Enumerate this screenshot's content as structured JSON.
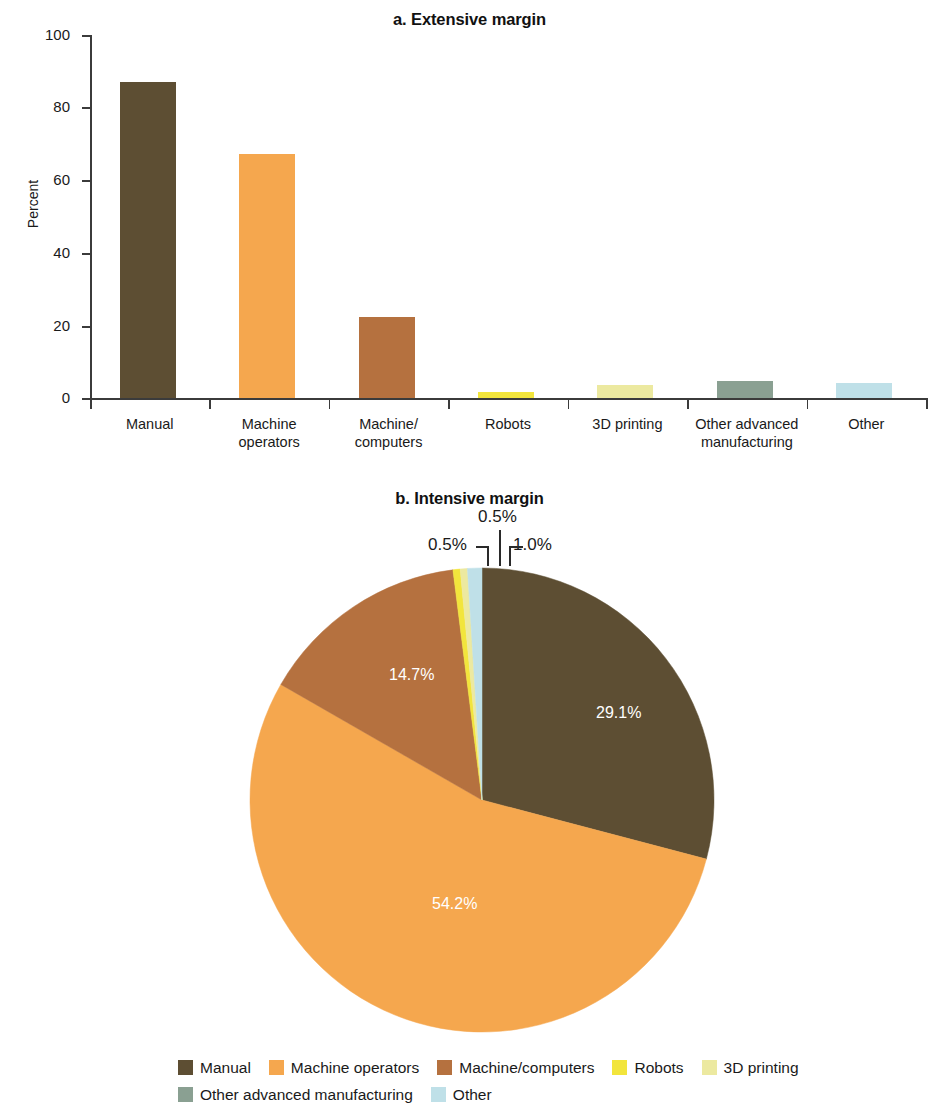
{
  "figure": {
    "panel_a_title": "a. Extensive margin",
    "panel_b_title": "b. Intensive margin"
  },
  "colors": {
    "manual": "#5d4e33",
    "machine_operators": "#f5a74e",
    "machine_computers": "#b5713f",
    "robots": "#f2e53c",
    "printing_3d": "#ece9a0",
    "other_advanced_manufacturing": "#8aa092",
    "other": "#bfe0e8",
    "axis": "#3b3b3b",
    "text": "#1a1a1a",
    "inner_label_text": "#ffffff"
  },
  "chart_data": [
    {
      "type": "bar",
      "title": "a. Extensive margin",
      "xlabel": "",
      "ylabel": "Percent",
      "ylim": [
        0,
        100
      ],
      "yticks": [
        "0",
        "20",
        "40",
        "60",
        "80",
        "100"
      ],
      "grid": false,
      "legend": "none",
      "categories": [
        "Manual",
        "Machine operators",
        "Machine/computers",
        "Robots",
        "3D printing",
        "Other advanced manufacturing",
        "Other"
      ],
      "category_lines": [
        [
          "Manual"
        ],
        [
          "Machine",
          "operators"
        ],
        [
          "Machine/",
          "computers"
        ],
        [
          "Robots"
        ],
        [
          "3D printing"
        ],
        [
          "Other advanced",
          "manufacturing"
        ],
        [
          "Other"
        ]
      ],
      "values": [
        87.0,
        67.2,
        22.3,
        1.6,
        3.6,
        4.8,
        4.0
      ],
      "bar_colors": [
        "#5d4e33",
        "#f5a74e",
        "#b5713f",
        "#f2e53c",
        "#ece9a0",
        "#8aa092",
        "#bfe0e8"
      ]
    },
    {
      "type": "pie",
      "title": "b. Intensive margin",
      "legend": "bottom",
      "labels": [
        "Manual",
        "Machine operators",
        "Machine/computers",
        "Robots",
        "3D printing",
        "Other advanced manufacturing",
        "Other"
      ],
      "values": [
        29.1,
        54.2,
        14.7,
        0.5,
        0.5,
        0.0,
        1.0
      ],
      "value_labels": [
        "29.1%",
        "54.2%",
        "14.7%",
        "0.5%",
        "0.5%",
        "",
        "1.0%"
      ],
      "slice_colors": [
        "#5d4e33",
        "#f5a74e",
        "#b5713f",
        "#f2e53c",
        "#ece9a0",
        "#8aa092",
        "#bfe0e8"
      ],
      "callout_labels": [
        "0.5%",
        "0.5%",
        "1.0%"
      ]
    }
  ],
  "bar_chart": {
    "yticks": [
      {
        "label": "100",
        "value": 100
      },
      {
        "label": "80",
        "value": 80
      },
      {
        "label": "60",
        "value": 60
      },
      {
        "label": "40",
        "value": 40
      },
      {
        "label": "20",
        "value": 20
      },
      {
        "label": "0",
        "value": 0
      }
    ],
    "ylabel": "Percent",
    "bars": [
      {
        "label_line1": "Manual",
        "label_line2": "",
        "value": 87.0
      },
      {
        "label_line1": "Machine",
        "label_line2": "operators",
        "value": 67.2
      },
      {
        "label_line1": "Machine/",
        "label_line2": "computers",
        "value": 22.3
      },
      {
        "label_line1": "Robots",
        "label_line2": "",
        "value": 1.6
      },
      {
        "label_line1": "3D printing",
        "label_line2": "",
        "value": 3.6
      },
      {
        "label_line1": "Other advanced",
        "label_line2": "manufacturing",
        "value": 4.8
      },
      {
        "label_line1": "Other",
        "label_line2": "",
        "value": 4.0
      }
    ]
  },
  "pie_chart": {
    "labels": {
      "manual": "29.1%",
      "machine_operators": "54.2%",
      "machine_computers": "14.7%",
      "robots": "0.5%",
      "printing_3d": "0.5%",
      "other": "1.0%"
    }
  },
  "legend": {
    "row1": [
      {
        "label": "Manual",
        "color": "#5d4e33"
      },
      {
        "label": "Machine operators",
        "color": "#f5a74e"
      },
      {
        "label": "Machine/computers",
        "color": "#b5713f"
      },
      {
        "label": "Robots",
        "color": "#f2e53c"
      },
      {
        "label": "3D printing",
        "color": "#ece9a0"
      }
    ],
    "row2": [
      {
        "label": "Other advanced manufacturing",
        "color": "#8aa092"
      },
      {
        "label": "Other",
        "color": "#bfe0e8"
      }
    ]
  }
}
